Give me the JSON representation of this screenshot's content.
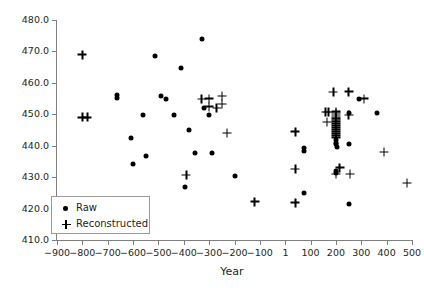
{
  "chart_data": {
    "type": "scatter",
    "title": "",
    "subtitle": "",
    "xlabel": "Year",
    "ylabel": "",
    "xlim": [
      -900,
      500
    ],
    "ylim": [
      410.0,
      480.0
    ],
    "grid": false,
    "legend_position": "lower-left",
    "x_ticks": [
      -900,
      -800,
      -700,
      -600,
      -500,
      -400,
      -300,
      -200,
      -100,
      1,
      100,
      200,
      300,
      400,
      500
    ],
    "x_tick_labels": [
      "−900",
      "−800",
      "−700",
      "−600",
      "−500",
      "−400",
      "−300",
      "−200",
      "−100",
      "1",
      "100",
      "200",
      "300",
      "400",
      "500"
    ],
    "y_ticks": [
      410.0,
      420.0,
      430.0,
      440.0,
      450.0,
      460.0,
      470.0,
      480.0
    ],
    "y_tick_labels": [
      "410.0",
      "420.0",
      "430.0",
      "440.0",
      "450.0",
      "460.0",
      "470.0",
      "480.0"
    ],
    "series": [
      {
        "name": "Raw",
        "marker": "circle",
        "color": "#000000",
        "points": [
          [
            -662,
            456.2
          ],
          [
            -662,
            455.2
          ],
          [
            -610,
            442.6
          ],
          [
            -600,
            434.2
          ],
          [
            -560,
            449.8
          ],
          [
            -548,
            436.6
          ],
          [
            -513,
            468.7
          ],
          [
            -490,
            455.8
          ],
          [
            -470,
            455.0
          ],
          [
            -440,
            449.9
          ],
          [
            -410,
            464.8
          ],
          [
            -395,
            427.0
          ],
          [
            -380,
            445.1
          ],
          [
            -355,
            437.6
          ],
          [
            -330,
            474.0
          ],
          [
            -320,
            451.9
          ],
          [
            -300,
            449.8
          ],
          [
            -290,
            437.6
          ],
          [
            -200,
            430.4
          ],
          [
            75,
            439.4
          ],
          [
            75,
            438.2
          ],
          [
            75,
            424.9
          ],
          [
            200,
            441.7
          ],
          [
            200,
            441.0
          ],
          [
            200,
            440.4
          ],
          [
            200,
            432.1
          ],
          [
            200,
            431.4
          ],
          [
            205,
            439.6
          ],
          [
            250,
            450.3
          ],
          [
            250,
            440.6
          ],
          [
            250,
            421.6
          ],
          [
            290,
            454.9
          ],
          [
            360,
            450.5
          ]
        ]
      },
      {
        "name": "Reconstructed",
        "marker": "plus",
        "color": "#000000",
        "points": [
          [
            -800,
            468.9
          ],
          [
            -800,
            449.0
          ],
          [
            -780,
            449.0
          ],
          [
            -390,
            430.6
          ],
          [
            -330,
            454.8
          ],
          [
            -300,
            455.0
          ],
          [
            -300,
            452.4
          ],
          [
            -270,
            452.0
          ],
          [
            -250,
            455.7
          ],
          [
            -250,
            453.2
          ],
          [
            -230,
            444.0
          ],
          [
            -120,
            422.2
          ],
          [
            40,
            444.4
          ],
          [
            40,
            432.5
          ],
          [
            40,
            421.8
          ],
          [
            160,
            450.6
          ],
          [
            170,
            450.6
          ],
          [
            165,
            447.5
          ],
          [
            190,
            457.0
          ],
          [
            200,
            450.8
          ],
          [
            200,
            450.3
          ],
          [
            200,
            449.7
          ],
          [
            200,
            449.1
          ],
          [
            200,
            448.6
          ],
          [
            200,
            448.1
          ],
          [
            200,
            447.6
          ],
          [
            200,
            447.0
          ],
          [
            200,
            446.3
          ],
          [
            200,
            445.7
          ],
          [
            200,
            445.1
          ],
          [
            200,
            444.4
          ],
          [
            200,
            443.8
          ],
          [
            200,
            443.2
          ],
          [
            200,
            442.5
          ],
          [
            200,
            430.9
          ],
          [
            215,
            433.0
          ],
          [
            250,
            457.1
          ],
          [
            250,
            449.7
          ],
          [
            255,
            431.0
          ],
          [
            310,
            455.0
          ],
          [
            390,
            437.9
          ],
          [
            480,
            428.1
          ]
        ]
      }
    ]
  },
  "legend": {
    "items": [
      {
        "label": "Raw",
        "marker": "circle"
      },
      {
        "label": "Reconstructed",
        "marker": "plus"
      }
    ]
  }
}
